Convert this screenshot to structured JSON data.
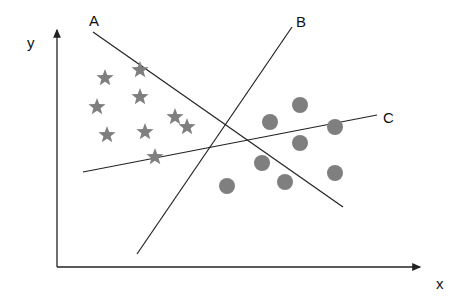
{
  "diagram": {
    "axes": {
      "x_label": "x",
      "y_label": "y"
    },
    "lines": [
      {
        "label": "A",
        "x1": 93,
        "y1": 32,
        "x2": 343,
        "y2": 207,
        "lx": 89,
        "ly": 26
      },
      {
        "label": "B",
        "x1": 292,
        "y1": 27,
        "x2": 137,
        "y2": 254,
        "lx": 296,
        "ly": 27
      },
      {
        "label": "C",
        "x1": 83,
        "y1": 172,
        "x2": 377,
        "y2": 115,
        "lx": 383,
        "ly": 123
      }
    ],
    "class_1": {
      "marker": "star",
      "color": "#7f7f7f",
      "points": [
        [
          105,
          78
        ],
        [
          140,
          70
        ],
        [
          97,
          107
        ],
        [
          140,
          97
        ],
        [
          107,
          135
        ],
        [
          145,
          132
        ],
        [
          175,
          117
        ],
        [
          187,
          127
        ],
        [
          155,
          157
        ]
      ]
    },
    "class_2": {
      "marker": "circle",
      "color": "#7f7f7f",
      "points": [
        [
          300,
          105
        ],
        [
          270,
          122
        ],
        [
          335,
          127
        ],
        [
          300,
          143
        ],
        [
          262,
          163
        ],
        [
          335,
          173
        ],
        [
          285,
          182
        ],
        [
          227,
          186
        ]
      ]
    }
  }
}
